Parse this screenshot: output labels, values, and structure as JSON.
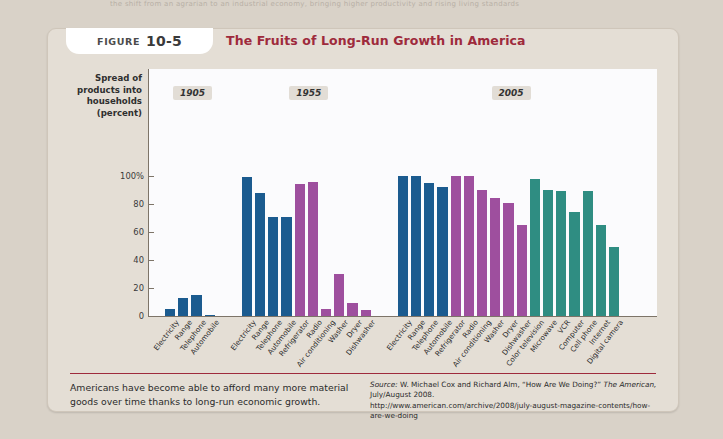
{
  "page": {
    "bleed_text": "the shift from an agrarian to an industrial economy, bringing higher productivity and rising living standards"
  },
  "figure": {
    "tag_label": "Figure",
    "tag_number": "10-5",
    "title": "The Fruits of Long-Run Growth in America",
    "caption": "Americans have become able to afford many more material goods over time thanks to long-run economic growth.",
    "source_prefix": "Source:",
    "source_line1": " W. Michael Cox and Richard Alm, “How Are We Doing?” ",
    "source_italic": "The American,",
    "source_line2": " July/August 2008.",
    "source_url": "http://www.american.com/archive/2008/july-august-magazine-contents/how-are-we-doing"
  },
  "colors": {
    "blue": "#1b5b8f",
    "purple": "#9e4f9e",
    "teal": "#2f8d82",
    "title": "#9e2a3c",
    "panel": "#e4ded5",
    "plot_bg": "#fbfbfd"
  },
  "chart_data": {
    "type": "bar",
    "title": "The Fruits of Long-Run Growth in America",
    "xlabel": "",
    "ylabel": "Spread of products into households (percent)",
    "ylim": [
      0,
      110
    ],
    "yticks": [
      "0",
      "20",
      "40",
      "60",
      "80",
      "100%"
    ],
    "ytick_values": [
      0,
      20,
      40,
      60,
      80,
      100
    ],
    "grid": false,
    "legend": "none",
    "groups": [
      {
        "year": "1905",
        "categories": [
          "Electricity",
          "Range",
          "Telephone",
          "Automobile"
        ],
        "values": [
          5,
          13,
          15,
          1
        ],
        "colors": [
          "blue",
          "blue",
          "blue",
          "blue"
        ]
      },
      {
        "year": "1955",
        "categories": [
          "Electricity",
          "Range",
          "Telephone",
          "Automobile",
          "Refrigerator",
          "Radio",
          "Air conditioning",
          "Washer",
          "Dryer",
          "Dishwasher"
        ],
        "values": [
          99,
          88,
          71,
          71,
          94,
          96,
          5,
          30,
          9,
          4
        ],
        "colors": [
          "blue",
          "blue",
          "blue",
          "blue",
          "purple",
          "purple",
          "purple",
          "purple",
          "purple",
          "purple"
        ]
      },
      {
        "year": "2005",
        "categories": [
          "Electricity",
          "Range",
          "Telephone",
          "Automobile",
          "Refrigerator",
          "Radio",
          "Air conditioning",
          "Washer",
          "Dryer",
          "Dishwasher",
          "Color television",
          "Microwave",
          "VCR",
          "Computer",
          "Cell phone",
          "Internet",
          "Digital camera"
        ],
        "values": [
          100,
          100,
          95,
          92,
          100,
          100,
          90,
          84,
          81,
          65,
          98,
          90,
          89,
          74,
          89,
          65,
          49
        ],
        "colors": [
          "blue",
          "blue",
          "blue",
          "blue",
          "purple",
          "purple",
          "purple",
          "purple",
          "purple",
          "purple",
          "teal",
          "teal",
          "teal",
          "teal",
          "teal",
          "teal",
          "teal"
        ]
      }
    ]
  }
}
